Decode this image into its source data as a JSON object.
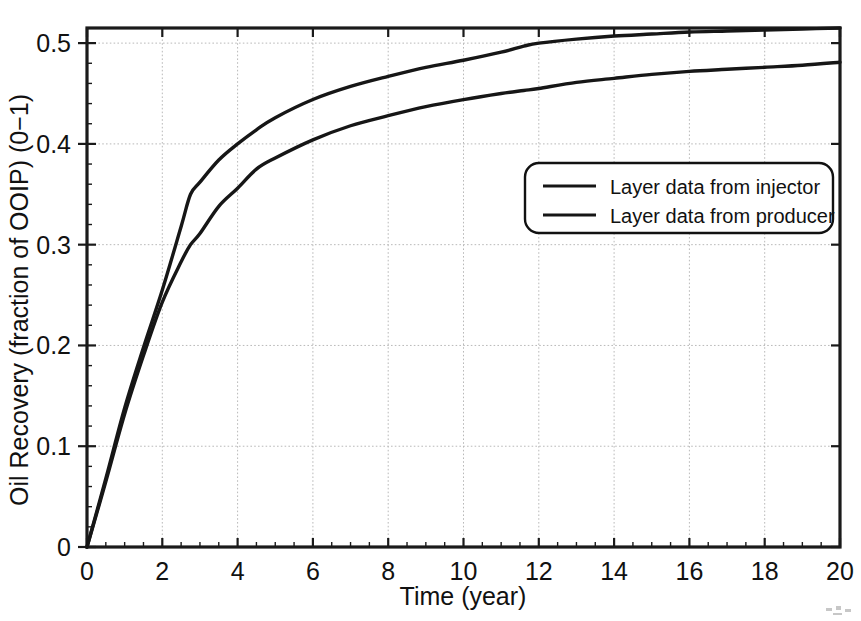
{
  "chart_data": {
    "type": "line",
    "title": "",
    "xlabel": "Time (year)",
    "ylabel": "Oil Recovery (fraction of OOIP) (0−1)",
    "xlim": [
      0,
      20
    ],
    "ylim": [
      0,
      0.515
    ],
    "grid": true,
    "legend_position": "upper-right-inside",
    "xticks": [
      0,
      2,
      4,
      6,
      8,
      10,
      12,
      14,
      16,
      18,
      20
    ],
    "xtick_labels": [
      "0",
      "2",
      "4",
      "6",
      "8",
      "10",
      "12",
      "14",
      "16",
      "18",
      "20"
    ],
    "yticks": [
      0,
      0.1,
      0.2,
      0.3,
      0.4,
      0.5
    ],
    "ytick_labels": [
      "0",
      "0.1",
      "0.2",
      "0.3",
      "0.4",
      "0.5"
    ],
    "x": [
      0,
      0.5,
      1,
      1.5,
      2,
      2.5,
      2.75,
      3,
      3.5,
      4,
      4.5,
      5,
      6,
      7,
      8,
      9,
      10,
      11,
      11.6,
      12,
      13,
      14,
      15,
      16,
      17,
      18,
      19,
      20
    ],
    "series": [
      {
        "name": "Layer data from injector",
        "color": "#161616",
        "values": [
          0.0,
          0.068,
          0.138,
          0.198,
          0.255,
          0.318,
          0.35,
          0.362,
          0.384,
          0.4,
          0.414,
          0.426,
          0.444,
          0.457,
          0.467,
          0.476,
          0.483,
          0.491,
          0.497,
          0.5,
          0.504,
          0.507,
          0.509,
          0.511,
          0.512,
          0.513,
          0.514,
          0.515
        ]
      },
      {
        "name": "Layer data from producer",
        "color": "#161616",
        "values": [
          0.0,
          0.065,
          0.132,
          0.19,
          0.243,
          0.283,
          0.3,
          0.311,
          0.338,
          0.356,
          0.375,
          0.386,
          0.404,
          0.418,
          0.428,
          0.437,
          0.444,
          0.45,
          0.453,
          0.455,
          0.461,
          0.465,
          0.469,
          0.472,
          0.474,
          0.476,
          0.478,
          0.481
        ]
      }
    ]
  },
  "legend": {
    "items": [
      {
        "label": "Layer data from injector"
      },
      {
        "label": "Layer data from producer"
      }
    ]
  },
  "axes": {
    "x_title": "Time (year)",
    "y_title": "Oil Recovery (fraction of OOIP) (0−1)",
    "x_tick_labels": [
      "0",
      "2",
      "4",
      "6",
      "8",
      "10",
      "12",
      "14",
      "16",
      "18",
      "20"
    ],
    "y_tick_labels": [
      "0.5",
      "0.4",
      "0.3",
      "0.2",
      "0.1",
      "0"
    ]
  }
}
